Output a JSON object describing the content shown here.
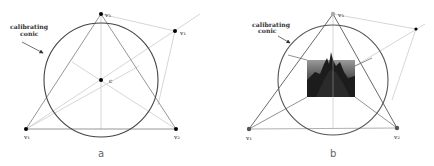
{
  "panels": [
    {
      "id": "a",
      "caption": "a",
      "callout": {
        "line1": "calibrating",
        "line2": "conic"
      },
      "vertices": {
        "v1": "v₁",
        "v2": "v₂",
        "v3": "v₃",
        "v4": "v₁",
        "c": "c"
      },
      "has_image": false
    },
    {
      "id": "b",
      "caption": "b",
      "callout": {
        "line1": "calibrating",
        "line2": "conic"
      },
      "vertices": {
        "v1": "v₁",
        "v2": "v₂",
        "v3": "v₃"
      },
      "has_image": true
    }
  ],
  "colors": {
    "conic": "#444444",
    "triangle": "#888888",
    "construction": "#c8c8c8",
    "point": "#000000"
  }
}
